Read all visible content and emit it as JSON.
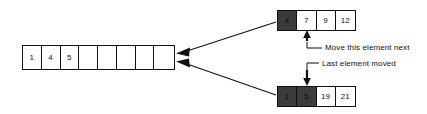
{
  "diagram": {
    "colors": {
      "highlight": "#3b3b3b",
      "stroke": "#111111",
      "background": "#ffffff"
    },
    "destination_array": {
      "name": "merged-output-array",
      "cells": [
        {
          "value": "1",
          "highlighted": false
        },
        {
          "value": "4",
          "highlighted": false
        },
        {
          "value": "5",
          "highlighted": false
        },
        {
          "value": "",
          "highlighted": false
        },
        {
          "value": "",
          "highlighted": false
        },
        {
          "value": "",
          "highlighted": false
        },
        {
          "value": "",
          "highlighted": false
        },
        {
          "value": "",
          "highlighted": false
        }
      ]
    },
    "top_array": {
      "name": "source-array-top",
      "cells": [
        {
          "value": "4",
          "highlighted": true
        },
        {
          "value": "7",
          "highlighted": false
        },
        {
          "value": "9",
          "highlighted": false
        },
        {
          "value": "12",
          "highlighted": false
        }
      ]
    },
    "bottom_array": {
      "name": "source-array-bottom",
      "cells": [
        {
          "value": "1",
          "highlighted": true
        },
        {
          "value": "5",
          "highlighted": true
        },
        {
          "value": "19",
          "highlighted": false
        },
        {
          "value": "21",
          "highlighted": false
        }
      ]
    },
    "annotations": {
      "move_next": "Move this element next",
      "last_moved": "Last element moved"
    }
  }
}
